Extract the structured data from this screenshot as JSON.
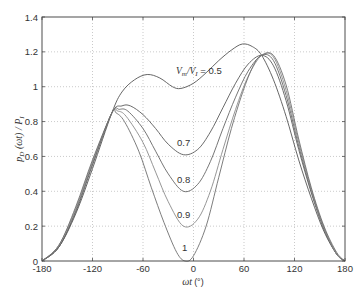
{
  "chart_data": {
    "type": "line",
    "title": "",
    "xlabel": "ωt (°)",
    "ylabel": "p_D (ωt) / P_I",
    "xlim": [
      -180,
      180
    ],
    "ylim": [
      0,
      1.4
    ],
    "xticks": [
      -180,
      -120,
      -60,
      0,
      60,
      120,
      180
    ],
    "yticks": [
      0,
      0.2,
      0.4,
      0.6,
      0.8,
      1,
      1.2,
      1.4
    ],
    "xtick_labels": [
      "-180",
      "-120",
      "-60",
      "0",
      "60",
      "120",
      "180"
    ],
    "ytick_labels": [
      "0",
      "0.2",
      "0.4",
      "0.6",
      "0.8",
      "1",
      "1.2",
      "1.4"
    ],
    "grid": true,
    "legend": "none (inline curve labels)",
    "series": [
      {
        "name": "Vm/VI = 0.5",
        "label": "V_m/V_I = 0.5",
        "points": [
          [
            -180,
            0
          ],
          [
            -160,
            0.08
          ],
          [
            -140,
            0.27
          ],
          [
            -120,
            0.53
          ],
          [
            -97,
            0.85
          ],
          [
            -85,
            0.97
          ],
          [
            -70,
            1.04
          ],
          [
            -55,
            1.07
          ],
          [
            -40,
            1.05
          ],
          [
            -25,
            1.0
          ],
          [
            -15,
            0.99
          ],
          [
            0,
            1.02
          ],
          [
            15,
            1.08
          ],
          [
            30,
            1.15
          ],
          [
            45,
            1.21
          ],
          [
            58,
            1.245
          ],
          [
            70,
            1.23
          ],
          [
            81,
            1.18
          ],
          [
            95,
            1.04
          ],
          [
            110,
            0.83
          ],
          [
            125,
            0.58
          ],
          [
            140,
            0.36
          ],
          [
            155,
            0.17
          ],
          [
            170,
            0.04
          ],
          [
            180,
            0
          ]
        ]
      },
      {
        "name": "Vm/VI = 0.7",
        "label": "0.7",
        "points": [
          [
            -180,
            0
          ],
          [
            -160,
            0.08
          ],
          [
            -140,
            0.28
          ],
          [
            -120,
            0.55
          ],
          [
            -97,
            0.85
          ],
          [
            -85,
            0.89
          ],
          [
            -75,
            0.89
          ],
          [
            -60,
            0.84
          ],
          [
            -45,
            0.76
          ],
          [
            -30,
            0.67
          ],
          [
            -12,
            0.61
          ],
          [
            5,
            0.64
          ],
          [
            20,
            0.74
          ],
          [
            35,
            0.88
          ],
          [
            50,
            1.02
          ],
          [
            65,
            1.13
          ],
          [
            81,
            1.18
          ],
          [
            95,
            1.12
          ],
          [
            110,
            0.92
          ],
          [
            125,
            0.64
          ],
          [
            140,
            0.39
          ],
          [
            155,
            0.18
          ],
          [
            170,
            0.04
          ],
          [
            180,
            0
          ]
        ]
      },
      {
        "name": "Vm/VI = 0.8",
        "label": "0.8",
        "points": [
          [
            -180,
            0
          ],
          [
            -160,
            0.08
          ],
          [
            -140,
            0.29
          ],
          [
            -120,
            0.56
          ],
          [
            -97,
            0.85
          ],
          [
            -88,
            0.87
          ],
          [
            -78,
            0.86
          ],
          [
            -60,
            0.76
          ],
          [
            -45,
            0.63
          ],
          [
            -30,
            0.5
          ],
          [
            -12,
            0.4
          ],
          [
            5,
            0.44
          ],
          [
            20,
            0.57
          ],
          [
            35,
            0.76
          ],
          [
            50,
            0.94
          ],
          [
            65,
            1.09
          ],
          [
            81,
            1.18
          ],
          [
            95,
            1.15
          ],
          [
            110,
            0.95
          ],
          [
            125,
            0.66
          ],
          [
            140,
            0.4
          ],
          [
            155,
            0.19
          ],
          [
            170,
            0.04
          ],
          [
            180,
            0
          ]
        ]
      },
      {
        "name": "Vm/VI = 0.9",
        "label": "0.9",
        "points": [
          [
            -180,
            0
          ],
          [
            -160,
            0.09
          ],
          [
            -140,
            0.3
          ],
          [
            -120,
            0.57
          ],
          [
            -97,
            0.85
          ],
          [
            -90,
            0.86
          ],
          [
            -80,
            0.83
          ],
          [
            -60,
            0.68
          ],
          [
            -45,
            0.51
          ],
          [
            -30,
            0.34
          ],
          [
            -12,
            0.2
          ],
          [
            5,
            0.24
          ],
          [
            20,
            0.4
          ],
          [
            35,
            0.64
          ],
          [
            50,
            0.87
          ],
          [
            65,
            1.06
          ],
          [
            81,
            1.18
          ],
          [
            95,
            1.17
          ],
          [
            110,
            0.98
          ],
          [
            125,
            0.68
          ],
          [
            140,
            0.41
          ],
          [
            155,
            0.19
          ],
          [
            170,
            0.04
          ],
          [
            180,
            0
          ]
        ]
      },
      {
        "name": "Vm/VI = 1",
        "label": "1",
        "points": [
          [
            -180,
            0
          ],
          [
            -160,
            0.09
          ],
          [
            -140,
            0.31
          ],
          [
            -120,
            0.58
          ],
          [
            -97,
            0.85
          ],
          [
            -92,
            0.85
          ],
          [
            -82,
            0.8
          ],
          [
            -65,
            0.63
          ],
          [
            -50,
            0.42
          ],
          [
            -35,
            0.22
          ],
          [
            -20,
            0.05
          ],
          [
            -10,
            0.0
          ],
          [
            0,
            0.03
          ],
          [
            15,
            0.2
          ],
          [
            30,
            0.48
          ],
          [
            45,
            0.76
          ],
          [
            60,
            0.99
          ],
          [
            72,
            1.13
          ],
          [
            81,
            1.18
          ],
          [
            95,
            1.18
          ],
          [
            110,
            1.01
          ],
          [
            125,
            0.7
          ],
          [
            140,
            0.42
          ],
          [
            155,
            0.2
          ],
          [
            170,
            0.05
          ],
          [
            180,
            0
          ]
        ]
      }
    ],
    "annotations": [
      {
        "text": "V_m/V_I = 0.5",
        "x": -35,
        "y": 1.1
      },
      {
        "text": "0.7",
        "x": -13,
        "y": 0.68
      },
      {
        "text": "0.8",
        "x": -13,
        "y": 0.47
      },
      {
        "text": "0.9",
        "x": -13,
        "y": 0.27
      },
      {
        "text": "1",
        "x": -12,
        "y": 0.07
      }
    ]
  },
  "colors": {
    "axis": "#4d4d4d",
    "grid": "#b3b3b3",
    "curves": [
      "#555555",
      "#5a5a5a",
      "#666666",
      "#8a8a8a",
      "#6e6e6e"
    ]
  },
  "axes": {
    "xlabel_main": "ωt",
    "xlabel_unit": "(°)",
    "ylabel_main": "p",
    "ylabel_sub": "D",
    "ylabel_mid": " (ωt) / P",
    "ylabel_sub2": "I",
    "label_v05_prefix": "V",
    "label_v05_sub1": "m",
    "label_v05_slash": "/V",
    "label_v05_sub2": "I",
    "label_v05_value": " = 0.5",
    "label_07": "0.7",
    "label_08": "0.8",
    "label_09": "0.9",
    "label_1": "1"
  }
}
